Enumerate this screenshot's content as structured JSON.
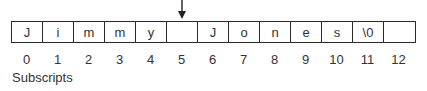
{
  "diagram": {
    "cells": [
      "J",
      "i",
      "m",
      "m",
      "y",
      "",
      "J",
      "o",
      "n",
      "e",
      "s",
      "\\0",
      ""
    ],
    "subscripts": [
      "0",
      "1",
      "2",
      "3",
      "4",
      "5",
      "6",
      "7",
      "8",
      "9",
      "10",
      "11",
      "12"
    ],
    "subscripts_label": "Subscripts",
    "arrow_index": 5
  }
}
